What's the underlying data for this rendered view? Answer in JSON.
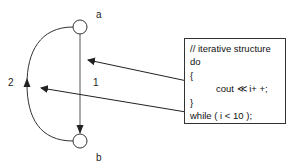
{
  "nodes": {
    "a": {
      "label": "a"
    },
    "b": {
      "label": "b"
    }
  },
  "edges": {
    "straight": {
      "label": "1",
      "from": "a",
      "to": "b"
    },
    "loop": {
      "label": "2",
      "from": "b",
      "to": "a"
    }
  },
  "code_box": {
    "lines": [
      "// iterative structure",
      "do",
      "{",
      "cout ≪ i+ +;",
      "}",
      "while ( i < 10 );"
    ]
  },
  "colors": {
    "stroke": "#333333",
    "background": "#ffffff"
  }
}
